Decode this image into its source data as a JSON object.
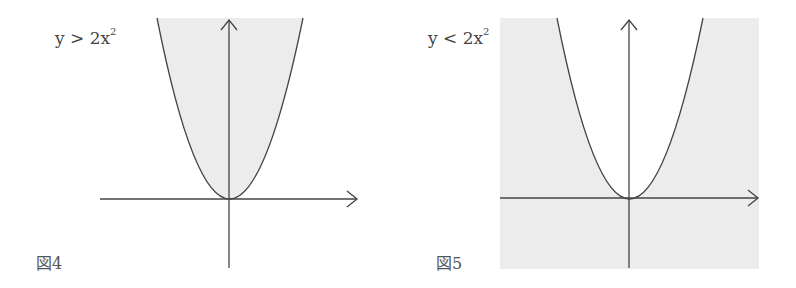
{
  "figures": [
    {
      "id": "fig4",
      "caption": "図4",
      "inequality": {
        "lhs": "y",
        "op": ">",
        "rhs_base": "2x",
        "rhs_exp": "2"
      },
      "shading": "inside-parabola"
    },
    {
      "id": "fig5",
      "caption": "図5",
      "inequality": {
        "lhs": "y",
        "op": "<",
        "rhs_base": "2x",
        "rhs_exp": "2"
      },
      "shading": "outside-parabola"
    }
  ],
  "colors": {
    "shade": "#ececec",
    "line": "#444444",
    "background": "#ffffff"
  }
}
